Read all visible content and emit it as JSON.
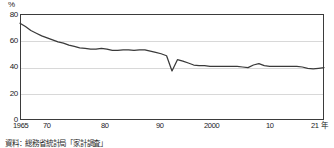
{
  "chart_data": {
    "type": "line",
    "title": "",
    "subtitle": "",
    "xlabel": "",
    "ylabel": "",
    "unit_label": "%",
    "x_axis_suffix": "年",
    "ylim": [
      0,
      80
    ],
    "xlim": [
      1965,
      2021
    ],
    "grid": true,
    "gridlines_y": [
      20,
      40,
      60,
      80
    ],
    "legend": [],
    "legend_position": "none",
    "y_ticks": [
      "80",
      "60",
      "40",
      "20",
      "0"
    ],
    "y_tick_values": [
      80,
      60,
      40,
      20,
      0
    ],
    "x_ticks": [
      "1965",
      "70",
      "80",
      "90",
      "2000",
      "10",
      "21"
    ],
    "x_tick_values": [
      1965,
      1970,
      1980,
      1990,
      2000,
      2010,
      2021
    ],
    "x_last_tick_with_unit": "21 年",
    "series": [
      {
        "name": "",
        "color": "#3a3a3a",
        "x": [
          1965,
          1966,
          1967,
          1968,
          1969,
          1970,
          1971,
          1972,
          1973,
          1974,
          1975,
          1976,
          1977,
          1978,
          1979,
          1980,
          1981,
          1982,
          1983,
          1984,
          1985,
          1986,
          1987,
          1988,
          1989,
          1990,
          1991,
          1992,
          1993,
          1994,
          1995,
          1996,
          1997,
          1998,
          1999,
          2000,
          2001,
          2002,
          2003,
          2004,
          2005,
          2006,
          2007,
          2008,
          2009,
          2010,
          2011,
          2012,
          2013,
          2014,
          2015,
          2016,
          2017,
          2018,
          2019,
          2020,
          2021
        ],
        "values": [
          73.0,
          70.5,
          67.5,
          65.5,
          63.5,
          62.0,
          60.5,
          59.0,
          58.0,
          56.5,
          55.5,
          54.5,
          54.0,
          53.5,
          53.5,
          54.0,
          53.5,
          52.5,
          52.5,
          53.0,
          53.0,
          52.5,
          53.0,
          53.0,
          52.0,
          51.0,
          50.0,
          48.5,
          37.0,
          45.5,
          44.5,
          43.0,
          41.5,
          41.0,
          41.0,
          40.5,
          40.5,
          40.5,
          40.5,
          40.5,
          40.5,
          40.0,
          39.5,
          41.5,
          42.5,
          41.0,
          40.5,
          40.5,
          40.5,
          40.5,
          40.5,
          40.5,
          40.0,
          39.0,
          38.5,
          39.0,
          39.5
        ]
      }
    ],
    "annotations": []
  },
  "figure": {
    "source_note": "資料：総務省統計局「家計調査」"
  }
}
